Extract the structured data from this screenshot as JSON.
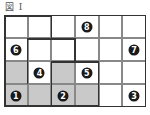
{
  "title": "図 I",
  "grid": {
    "cols": 6,
    "rows": 4,
    "cells": [
      {
        "r": 0,
        "c": 0,
        "shaded": false,
        "num": ""
      },
      {
        "r": 0,
        "c": 1,
        "shaded": false,
        "num": ""
      },
      {
        "r": 0,
        "c": 2,
        "shaded": false,
        "num": ""
      },
      {
        "r": 0,
        "c": 3,
        "shaded": false,
        "num": "8"
      },
      {
        "r": 0,
        "c": 4,
        "shaded": false,
        "num": ""
      },
      {
        "r": 0,
        "c": 5,
        "shaded": false,
        "num": ""
      },
      {
        "r": 1,
        "c": 0,
        "shaded": false,
        "num": "6"
      },
      {
        "r": 1,
        "c": 1,
        "shaded": false,
        "num": ""
      },
      {
        "r": 1,
        "c": 2,
        "shaded": false,
        "num": ""
      },
      {
        "r": 1,
        "c": 3,
        "shaded": false,
        "num": ""
      },
      {
        "r": 1,
        "c": 4,
        "shaded": false,
        "num": ""
      },
      {
        "r": 1,
        "c": 5,
        "shaded": false,
        "num": "7"
      },
      {
        "r": 2,
        "c": 0,
        "shaded": true,
        "num": ""
      },
      {
        "r": 2,
        "c": 1,
        "shaded": false,
        "num": "4"
      },
      {
        "r": 2,
        "c": 2,
        "shaded": true,
        "num": ""
      },
      {
        "r": 2,
        "c": 3,
        "shaded": false,
        "num": "5"
      },
      {
        "r": 2,
        "c": 4,
        "shaded": false,
        "num": ""
      },
      {
        "r": 2,
        "c": 5,
        "shaded": false,
        "num": ""
      },
      {
        "r": 3,
        "c": 0,
        "shaded": true,
        "num": "1"
      },
      {
        "r": 3,
        "c": 1,
        "shaded": true,
        "num": ""
      },
      {
        "r": 3,
        "c": 2,
        "shaded": true,
        "num": "2"
      },
      {
        "r": 3,
        "c": 3,
        "shaded": true,
        "num": ""
      },
      {
        "r": 3,
        "c": 4,
        "shaded": false,
        "num": ""
      },
      {
        "r": 3,
        "c": 5,
        "shaded": false,
        "num": "3"
      }
    ],
    "colors": {
      "shaded": "#c9c9c9",
      "circle": "#1a1a1a",
      "border": "#333333"
    }
  }
}
